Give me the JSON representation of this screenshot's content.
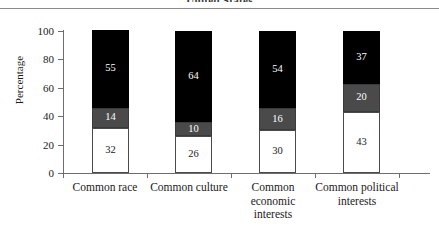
{
  "figure": {
    "clipped_title": "United States",
    "y_axis_title": "Percentage"
  },
  "chart_data": {
    "type": "bar",
    "stacked": true,
    "title": "United States",
    "xlabel": "",
    "ylabel": "Percentage",
    "ylim": [
      0,
      100
    ],
    "yticks": [
      "0",
      "20",
      "40",
      "60",
      "80",
      "100"
    ],
    "grid": false,
    "legend": "none",
    "categories": [
      "Common race",
      "Common culture",
      "Common economic interests",
      "Common political interests"
    ],
    "series": [
      {
        "name": "white-segment",
        "color": "#ffffff",
        "values": [
          32,
          26,
          30,
          43
        ]
      },
      {
        "name": "gray-segment",
        "color": "#4a4a4a",
        "values": [
          14,
          10,
          16,
          20
        ]
      },
      {
        "name": "black-segment",
        "color": "#000000",
        "values": [
          55,
          64,
          54,
          37
        ]
      }
    ],
    "bars": [
      {
        "category": "Common race",
        "label_lines": [
          "Common race"
        ],
        "segments": [
          {
            "name": "white-segment",
            "value": 32,
            "label": "32"
          },
          {
            "name": "gray-segment",
            "value": 14,
            "label": "14"
          },
          {
            "name": "black-segment",
            "value": 55,
            "label": "55"
          }
        ]
      },
      {
        "category": "Common culture",
        "label_lines": [
          "Common culture"
        ],
        "segments": [
          {
            "name": "white-segment",
            "value": 26,
            "label": "26"
          },
          {
            "name": "gray-segment",
            "value": 10,
            "label": "10"
          },
          {
            "name": "black-segment",
            "value": 64,
            "label": "64"
          }
        ]
      },
      {
        "category": "Common economic interests",
        "label_lines": [
          "Common",
          "economic",
          "interests"
        ],
        "segments": [
          {
            "name": "white-segment",
            "value": 30,
            "label": "30"
          },
          {
            "name": "gray-segment",
            "value": 16,
            "label": "16"
          },
          {
            "name": "black-segment",
            "value": 54,
            "label": "54"
          }
        ]
      },
      {
        "category": "Common political interests",
        "label_lines": [
          "Common political",
          "interests"
        ],
        "segments": [
          {
            "name": "white-segment",
            "value": 43,
            "label": "43"
          },
          {
            "name": "gray-segment",
            "value": 20,
            "label": "20"
          },
          {
            "name": "black-segment",
            "value": 37,
            "label": "37"
          }
        ]
      }
    ]
  }
}
